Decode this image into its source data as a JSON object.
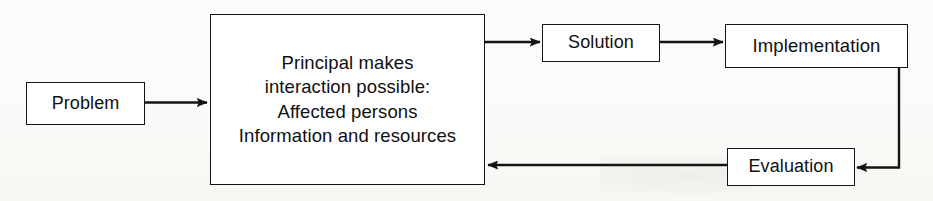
{
  "diagram": {
    "background_color": "#fdfdfc",
    "stroke_color": "#141414",
    "nodes": {
      "problem": {
        "label": "Problem",
        "shape": "rectangle"
      },
      "principal": {
        "label": "Principal makes\ninteraction possible:\nAffected persons\nInformation and resources",
        "line1": "Principal makes",
        "line2": "interaction possible:",
        "line3": "Affected persons",
        "line4": "Information and resources",
        "shape": "rectangle"
      },
      "solution": {
        "label": "Solution",
        "shape": "rectangle"
      },
      "implementation": {
        "label": "Implementation",
        "shape": "rectangle"
      },
      "evaluation": {
        "label": "Evaluation",
        "shape": "rectangle"
      }
    },
    "edges": [
      {
        "id": "problem-to-principal",
        "from": "problem",
        "to": "principal",
        "direction": "right",
        "style": "straight-arrow"
      },
      {
        "id": "principal-to-solution",
        "from": "principal",
        "to": "solution",
        "direction": "right",
        "style": "straight-arrow"
      },
      {
        "id": "solution-to-implementation",
        "from": "solution",
        "to": "implementation",
        "direction": "right",
        "style": "straight-arrow"
      },
      {
        "id": "implementation-to-evaluation",
        "from": "implementation",
        "to": "evaluation",
        "direction": "down-then-left",
        "style": "elbow-arrow"
      },
      {
        "id": "evaluation-to-principal",
        "from": "evaluation",
        "to": "principal",
        "direction": "left",
        "style": "straight-arrow"
      }
    ]
  }
}
